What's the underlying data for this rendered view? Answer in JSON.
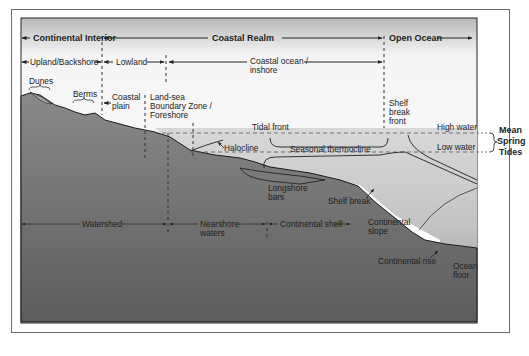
{
  "zones_top": [
    {
      "id": "continental-interior",
      "label": "Continental Interior"
    },
    {
      "id": "coastal-realm",
      "label": "Coastal Realm"
    },
    {
      "id": "open-ocean",
      "label": "Open Ocean"
    }
  ],
  "zones_second": [
    {
      "id": "upland",
      "label": "Upland/Backshore"
    },
    {
      "id": "lowland",
      "label": "Lowland"
    },
    {
      "id": "coastal-ocean",
      "label_line1": "Coastal ocean /",
      "label_line2": "inshore"
    }
  ],
  "features": {
    "dunes": "Dunes",
    "berms": "Berms",
    "coastal_plain_1": "Coastal",
    "coastal_plain_2": "plain",
    "land_sea_1": "Land-sea",
    "land_sea_2": "Boundary Zone /",
    "land_sea_3": "Foreshore",
    "shelf_break_front_1": "Shelf",
    "shelf_break_front_2": "break",
    "shelf_break_front_3": "front",
    "tidal_front": "Tidal front",
    "halocline": "Halocline",
    "seasonal_thermocline": "Seasonal thermocline",
    "high_water": "High water",
    "low_water": "Low water",
    "mean_spring_tides_1": "Mean",
    "mean_spring_tides_2": "Spring",
    "mean_spring_tides_3": "Tides",
    "longshore_bars_1": "Longshore",
    "longshore_bars_2": "bars",
    "shelf_break": "Shelf break",
    "continental_slope_1": "Continental",
    "continental_slope_2": "slope",
    "continental_rise": "Continental rise",
    "ocean_floor_1": "Ocean",
    "ocean_floor_2": "floor"
  },
  "zones_bottom": [
    {
      "id": "watershed",
      "label": "Watershed"
    },
    {
      "id": "nearshore",
      "label_line1": "Nearshore",
      "label_line2": "waters"
    },
    {
      "id": "continental-shelf",
      "label": "Continental shelf"
    }
  ],
  "colors": {
    "land": "#6e6e6e",
    "water": "#cfcfcf",
    "sky_top": "#bdbdbd",
    "outline": "#1a1a1a"
  }
}
